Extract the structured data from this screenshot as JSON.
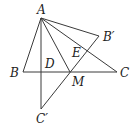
{
  "diagram": {
    "type": "geometry",
    "points": {
      "A": {
        "label": "A",
        "x": 41,
        "y": 18
      },
      "B": {
        "label": "B",
        "x": 23,
        "y": 72
      },
      "C": {
        "label": "C",
        "x": 117,
        "y": 72
      },
      "D": {
        "label": "D",
        "x": 41,
        "y": 72
      },
      "M": {
        "label": "M",
        "x": 70,
        "y": 72
      },
      "B_prime": {
        "label": "B′",
        "x": 99,
        "y": 36
      },
      "C_prime": {
        "label": "C′",
        "x": 41,
        "y": 109
      },
      "E": {
        "label": "E",
        "x": 86,
        "y": 52
      }
    },
    "segments": [
      [
        "A",
        "B"
      ],
      [
        "B",
        "C"
      ],
      [
        "A",
        "C"
      ],
      [
        "A",
        "M"
      ],
      [
        "A",
        "B_prime"
      ],
      [
        "A",
        "C_prime"
      ],
      [
        "B_prime",
        "C_prime"
      ]
    ],
    "colors": {
      "line": "#3a3a3a",
      "text": "#222222",
      "background": "#ffffff"
    }
  }
}
